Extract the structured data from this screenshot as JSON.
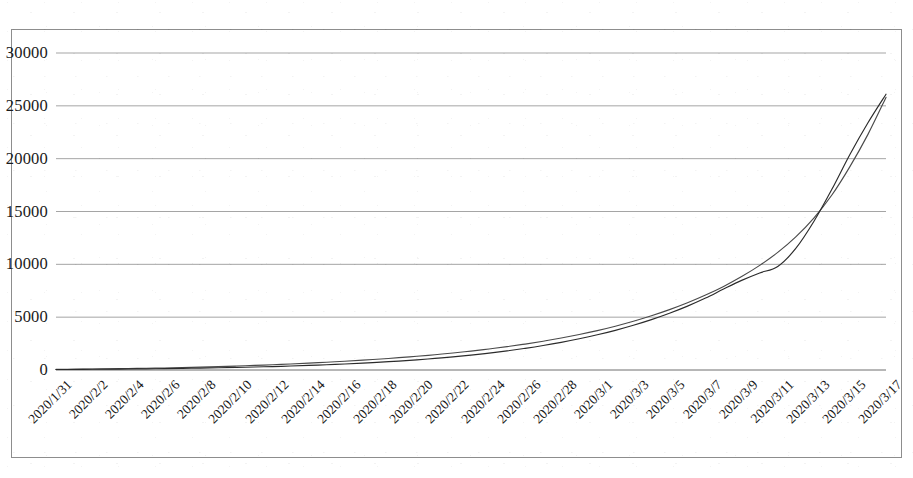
{
  "chart_data": {
    "type": "line",
    "title": "",
    "subtitle": "",
    "xlabel": "",
    "ylabel": "",
    "ylim": [
      0,
      30000
    ],
    "ytick_values": [
      0,
      5000,
      10000,
      15000,
      20000,
      25000,
      30000
    ],
    "ytick_labels": [
      "0",
      "5000",
      "10000",
      "15000",
      "20000",
      "25000",
      "30000"
    ],
    "grid": "horizontal",
    "legend": "none",
    "legend_entries": [],
    "annotations": [],
    "line_color_series_1": "#4a4a4a",
    "line_color_series_2": "#2b2b2b",
    "x": [
      "2020/1/31",
      "2020/2/1",
      "2020/2/2",
      "2020/2/3",
      "2020/2/4",
      "2020/2/5",
      "2020/2/6",
      "2020/2/7",
      "2020/2/8",
      "2020/2/9",
      "2020/2/10",
      "2020/2/11",
      "2020/2/12",
      "2020/2/13",
      "2020/2/14",
      "2020/2/15",
      "2020/2/16",
      "2020/2/17",
      "2020/2/18",
      "2020/2/19",
      "2020/2/20",
      "2020/2/21",
      "2020/2/22",
      "2020/2/23",
      "2020/2/24",
      "2020/2/25",
      "2020/2/26",
      "2020/2/27",
      "2020/2/28",
      "2020/2/29",
      "2020/3/1",
      "2020/3/2",
      "2020/3/3",
      "2020/3/4",
      "2020/3/5",
      "2020/3/6",
      "2020/3/7",
      "2020/3/8",
      "2020/3/9",
      "2020/3/10",
      "2020/3/11",
      "2020/3/12",
      "2020/3/13",
      "2020/3/14",
      "2020/3/15",
      "2020/3/16",
      "2020/3/17"
    ],
    "xtick_labels": [
      "2020/1/31",
      "2020/2/2",
      "2020/2/4",
      "2020/2/6",
      "2020/2/8",
      "2020/2/10",
      "2020/2/12",
      "2020/2/14",
      "2020/2/16",
      "2020/2/18",
      "2020/2/20",
      "2020/2/22",
      "2020/2/24",
      "2020/2/26",
      "2020/2/28",
      "2020/3/1",
      "2020/3/3",
      "2020/3/5",
      "2020/3/7",
      "2020/3/9",
      "2020/3/11",
      "2020/3/13",
      "2020/3/15",
      "2020/3/17"
    ],
    "series": [
      {
        "name": "series-1",
        "values": [
          60,
          75,
          92,
          112,
          135,
          162,
          194,
          232,
          275,
          322,
          375,
          435,
          500,
          572,
          650,
          735,
          828,
          930,
          1042,
          1165,
          1300,
          1448,
          1610,
          1790,
          1990,
          2210,
          2455,
          2725,
          3025,
          3360,
          3730,
          4145,
          4610,
          5130,
          5710,
          6360,
          7090,
          7910,
          8840,
          9900,
          11130,
          12600,
          14380,
          16560,
          19250,
          22300,
          25800
        ]
      },
      {
        "name": "series-2",
        "values": [
          45,
          55,
          66,
          79,
          94,
          111,
          131,
          154,
          180,
          210,
          244,
          283,
          326,
          376,
          432,
          496,
          568,
          650,
          742,
          846,
          963,
          1095,
          1243,
          1410,
          1598,
          1810,
          2048,
          2315,
          2615,
          2952,
          3330,
          3755,
          4232,
          4768,
          5370,
          6045,
          6805,
          7660,
          8480,
          9180,
          9800,
          11500,
          14050,
          17100,
          20400,
          23400,
          26100
        ]
      }
    ]
  }
}
